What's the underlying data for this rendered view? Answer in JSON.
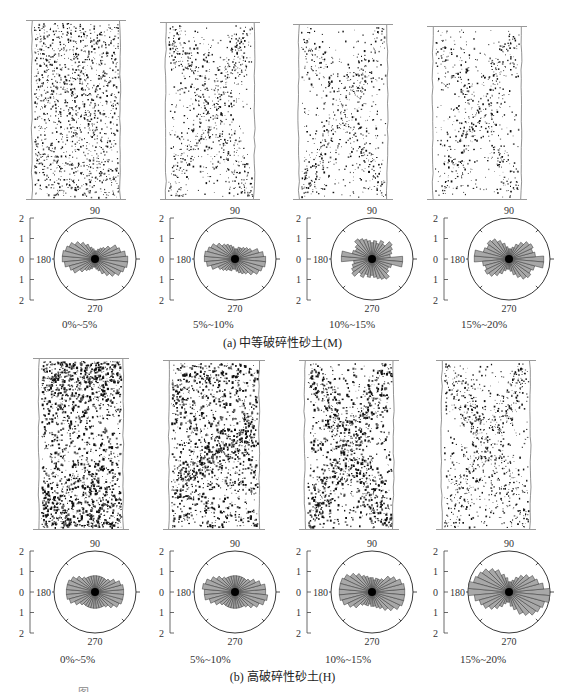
{
  "figure": {
    "panel_a": {
      "caption": "(a) 中等破碎性砂土(M)",
      "group": "M",
      "specimens": [
        {
          "label": "0%~5%",
          "density": 0.55,
          "pattern": "uniform"
        },
        {
          "label": "5%~10%",
          "density": 0.45,
          "pattern": "x-band"
        },
        {
          "label": "10%~15%",
          "density": 0.35,
          "pattern": "x-band"
        },
        {
          "label": "15%~20%",
          "density": 0.3,
          "pattern": "x-band"
        }
      ]
    },
    "panel_b": {
      "caption": "(b) 高破碎性砂土(H)",
      "group": "H",
      "specimens": [
        {
          "label": "0%~5%",
          "density": 1.0,
          "pattern": "dense-ends"
        },
        {
          "label": "5%~10%",
          "density": 0.9,
          "pattern": "diagonal"
        },
        {
          "label": "10%~15%",
          "density": 0.7,
          "pattern": "x-band"
        },
        {
          "label": "15%~20%",
          "density": 0.5,
          "pattern": "x-band"
        }
      ]
    },
    "rose_axis": {
      "angle_labels": {
        "top": "90",
        "left": "180",
        "right": "0",
        "bottom": "270"
      },
      "scale_labels": [
        "2",
        "1",
        "0",
        "1",
        "2"
      ]
    },
    "bottom_caption": "图"
  },
  "chart_data": [
    {
      "type": "rose",
      "title": "(a) 中等破碎性砂土(M) 0%~5%",
      "angles_deg": [
        0,
        10,
        20,
        30,
        40,
        50,
        60,
        70,
        80,
        90,
        100,
        110,
        120,
        130,
        140,
        150,
        160,
        170
      ],
      "radii": [
        1.6,
        1.5,
        1.3,
        1.2,
        0.9,
        0.7,
        0.6,
        0.5,
        0.4,
        0.4,
        0.5,
        0.6,
        0.8,
        1.0,
        1.2,
        1.4,
        1.5,
        1.6
      ],
      "rlim": [
        0,
        2
      ]
    },
    {
      "type": "rose",
      "title": "(a) 中等破碎性砂土(M) 5%~10%",
      "angles_deg": [
        0,
        10,
        20,
        30,
        40,
        50,
        60,
        70,
        80,
        90,
        100,
        110,
        120,
        130,
        140,
        150,
        160,
        170
      ],
      "radii": [
        1.5,
        1.4,
        1.2,
        0.9,
        0.8,
        0.7,
        0.6,
        0.6,
        0.5,
        0.5,
        0.6,
        0.7,
        0.8,
        0.9,
        1.1,
        1.3,
        1.4,
        1.5
      ],
      "rlim": [
        0,
        2
      ]
    },
    {
      "type": "rose",
      "title": "(a) 中等破碎性砂土(M) 10%~15%",
      "angles_deg": [
        0,
        10,
        20,
        30,
        40,
        50,
        60,
        70,
        80,
        90,
        100,
        110,
        120,
        130,
        140,
        150,
        160,
        170
      ],
      "radii": [
        1.5,
        0.9,
        1.0,
        1.1,
        1.2,
        0.9,
        1.0,
        0.8,
        0.9,
        0.8,
        0.9,
        1.0,
        1.1,
        1.2,
        1.0,
        0.9,
        1.0,
        1.5
      ],
      "rlim": [
        0,
        2
      ]
    },
    {
      "type": "rose",
      "title": "(a) 中等破碎性砂土(M) 15%~20%",
      "angles_deg": [
        0,
        10,
        20,
        30,
        40,
        50,
        60,
        70,
        80,
        90,
        100,
        110,
        120,
        130,
        140,
        150,
        160,
        170
      ],
      "radii": [
        1.7,
        1.3,
        1.2,
        1.3,
        1.2,
        1.0,
        0.8,
        0.6,
        0.5,
        0.5,
        0.6,
        0.8,
        1.0,
        1.2,
        1.3,
        1.2,
        1.3,
        1.7
      ],
      "rlim": [
        0,
        2
      ]
    },
    {
      "type": "rose",
      "title": "(b) 高破碎性砂土(H) 0%~5%",
      "angles_deg": [
        0,
        10,
        20,
        30,
        40,
        50,
        60,
        70,
        80,
        90,
        100,
        110,
        120,
        130,
        140,
        150,
        160,
        170
      ],
      "radii": [
        1.4,
        1.4,
        1.3,
        1.1,
        0.9,
        0.8,
        0.8,
        0.8,
        0.8,
        0.8,
        0.8,
        0.8,
        0.8,
        0.9,
        1.1,
        1.3,
        1.4,
        1.4
      ],
      "rlim": [
        0,
        2
      ]
    },
    {
      "type": "rose",
      "title": "(b) 高破碎性砂土(H) 5%~10%",
      "angles_deg": [
        0,
        10,
        20,
        30,
        40,
        50,
        60,
        70,
        80,
        90,
        100,
        110,
        120,
        130,
        140,
        150,
        160,
        170
      ],
      "radii": [
        1.5,
        1.5,
        1.3,
        1.1,
        0.9,
        0.8,
        0.8,
        0.8,
        0.8,
        0.8,
        0.8,
        0.8,
        0.8,
        0.9,
        1.1,
        1.3,
        1.5,
        1.6
      ],
      "rlim": [
        0,
        2
      ]
    },
    {
      "type": "rose",
      "title": "(b) 高破碎性砂土(H) 10%~15%",
      "angles_deg": [
        0,
        10,
        20,
        30,
        40,
        50,
        60,
        70,
        80,
        90,
        100,
        110,
        120,
        130,
        140,
        150,
        160,
        170
      ],
      "radii": [
        1.6,
        1.6,
        1.5,
        1.3,
        1.1,
        0.8,
        0.7,
        0.7,
        0.6,
        0.7,
        0.7,
        0.8,
        0.9,
        1.1,
        1.3,
        1.5,
        1.6,
        1.6
      ],
      "rlim": [
        0,
        2
      ]
    },
    {
      "type": "rose",
      "title": "(b) 高破碎性砂土(H) 15%~20%",
      "angles_deg": [
        0,
        10,
        20,
        30,
        40,
        50,
        60,
        70,
        80,
        90,
        100,
        110,
        120,
        130,
        140,
        150,
        160,
        170
      ],
      "radii": [
        2.0,
        1.7,
        1.5,
        1.4,
        1.2,
        1.0,
        0.8,
        0.6,
        0.5,
        0.5,
        0.7,
        0.9,
        1.2,
        1.4,
        1.6,
        1.7,
        1.8,
        2.0
      ],
      "rlim": [
        0,
        2
      ]
    }
  ]
}
